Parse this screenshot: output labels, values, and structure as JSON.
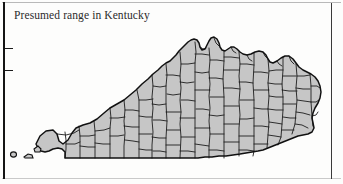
{
  "figure": {
    "caption": "Presumed range in Kentucky",
    "map_region_name": "Kentucky",
    "map_subdivision_type": "counties",
    "shading_meaning": "Presumed range",
    "colors": {
      "range_fill": "#c6c6c6",
      "county_border": "#1d1d1d",
      "state_border": "#111111",
      "caption_text": "#2b2b2b",
      "page_background": "#fdfdfc",
      "frame_rule": "#141414"
    }
  },
  "frame": {
    "left_rule_name": "page-edge-rule",
    "right_rule_name": "column-edge-rule",
    "tick_marks": [
      {
        "name": "left-tick-upper"
      },
      {
        "name": "left-tick-lower"
      }
    ]
  }
}
